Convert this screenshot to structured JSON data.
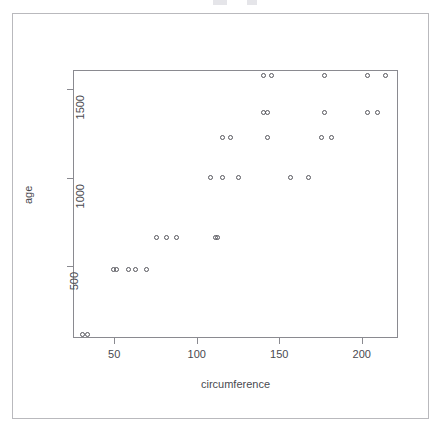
{
  "window": {
    "background_color": "#ffffff",
    "frame_color": "#b9b9bd"
  },
  "chart_data": {
    "type": "scatter",
    "title": "",
    "xlabel": "circumference",
    "ylabel": "age",
    "xlim": [
      25,
      222
    ],
    "ylim": [
      90,
      1610
    ],
    "xticks": [
      50,
      100,
      150,
      200
    ],
    "xticklabels": [
      "50",
      "100",
      "150",
      "200"
    ],
    "yticks": [
      500,
      1000,
      1500
    ],
    "yticklabels": [
      "500",
      "1000",
      "1500"
    ],
    "grid": false,
    "legend": null,
    "marker": "open-circle",
    "marker_color": "#56565c",
    "x": [
      30,
      33,
      30,
      32,
      30,
      30,
      32,
      30,
      33,
      58,
      69,
      51,
      62,
      49,
      51,
      62,
      49,
      51,
      87,
      111,
      75,
      112,
      81,
      75,
      112,
      81,
      75,
      115,
      156,
      108,
      167,
      125,
      108,
      125,
      120,
      108,
      120,
      142,
      115,
      179,
      142,
      115,
      179,
      142,
      115,
      142,
      177,
      140,
      203,
      145,
      140,
      214,
      145,
      140
    ],
    "y": [
      118,
      118,
      118,
      118,
      118,
      118,
      118,
      118,
      118,
      484,
      484,
      484,
      484,
      484,
      484,
      484,
      484,
      484,
      664,
      664,
      664,
      664,
      664,
      664,
      664,
      664,
      664,
      1004,
      1004,
      1004,
      1004,
      1004,
      1004,
      1004,
      1004,
      1004,
      1231,
      1231,
      1231,
      1231,
      1231,
      1231,
      1231,
      1231,
      1231,
      1372,
      1372,
      1372,
      1372,
      1372,
      1372,
      1372,
      1372,
      1372
    ],
    "points": [
      {
        "x": 30,
        "y": 118
      },
      {
        "x": 33,
        "y": 118
      },
      {
        "x": 49,
        "y": 484
      },
      {
        "x": 51,
        "y": 484
      },
      {
        "x": 58,
        "y": 484
      },
      {
        "x": 62,
        "y": 484
      },
      {
        "x": 69,
        "y": 484
      },
      {
        "x": 75,
        "y": 664
      },
      {
        "x": 81,
        "y": 664
      },
      {
        "x": 87,
        "y": 664
      },
      {
        "x": 111,
        "y": 664
      },
      {
        "x": 112,
        "y": 664
      },
      {
        "x": 108,
        "y": 1004
      },
      {
        "x": 115,
        "y": 1004
      },
      {
        "x": 125,
        "y": 1004
      },
      {
        "x": 156,
        "y": 1004
      },
      {
        "x": 167,
        "y": 1004
      },
      {
        "x": 115,
        "y": 1231
      },
      {
        "x": 120,
        "y": 1231
      },
      {
        "x": 142,
        "y": 1231
      },
      {
        "x": 175,
        "y": 1231
      },
      {
        "x": 181,
        "y": 1231
      },
      {
        "x": 140,
        "y": 1372
      },
      {
        "x": 142,
        "y": 1372
      },
      {
        "x": 177,
        "y": 1372
      },
      {
        "x": 203,
        "y": 1372
      },
      {
        "x": 209,
        "y": 1372
      },
      {
        "x": 140,
        "y": 1582
      },
      {
        "x": 145,
        "y": 1582
      },
      {
        "x": 177,
        "y": 1582
      },
      {
        "x": 203,
        "y": 1582
      },
      {
        "x": 214,
        "y": 1582
      }
    ]
  }
}
